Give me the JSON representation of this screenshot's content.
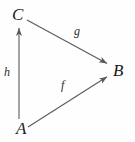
{
  "diagram": {
    "kind": "commutative-triangle",
    "stroke_color": "#5a5a5a",
    "text_color": "#1a1a1a",
    "background_color": "#fefefe",
    "nodes": [
      {
        "id": "C",
        "label": "C",
        "x": 20,
        "y": 15
      },
      {
        "id": "A",
        "label": "A",
        "x": 22,
        "y": 128
      },
      {
        "id": "B",
        "label": "B",
        "x": 118,
        "y": 70
      }
    ],
    "edges": [
      {
        "id": "h",
        "label": "h",
        "from": "A",
        "to": "C",
        "x1": 19,
        "y1": 119,
        "x2": 19,
        "y2": 25,
        "label_x": 7,
        "label_y": 72
      },
      {
        "id": "g",
        "label": "g",
        "from": "C",
        "to": "B",
        "x1": 27,
        "y1": 20,
        "x2": 110,
        "y2": 65,
        "label_x": 77,
        "label_y": 31
      },
      {
        "id": "f",
        "label": "f",
        "from": "A",
        "to": "B",
        "x1": 28,
        "y1": 127,
        "x2": 110,
        "y2": 75,
        "label_x": 64,
        "label_y": 85
      }
    ]
  }
}
